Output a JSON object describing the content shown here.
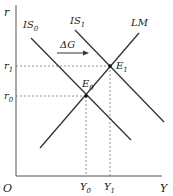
{
  "diagram": {
    "axes": {
      "y_label": "r",
      "x_label": "Y",
      "origin_label": "O"
    },
    "curves": {
      "is0": "IS",
      "is0_sub": "0",
      "is1": "IS",
      "is1_sub": "1",
      "lm": "LM"
    },
    "shift_label": "ΔG",
    "points": {
      "e0": "E",
      "e0_sub": "0",
      "e1": "E",
      "e1_sub": "1"
    },
    "ticks": {
      "r0": "r",
      "r0_sub": "0",
      "r1": "r",
      "r1_sub": "1",
      "y0": "Y",
      "y0_sub": "0",
      "y1": "Y",
      "y1_sub": "1"
    }
  }
}
